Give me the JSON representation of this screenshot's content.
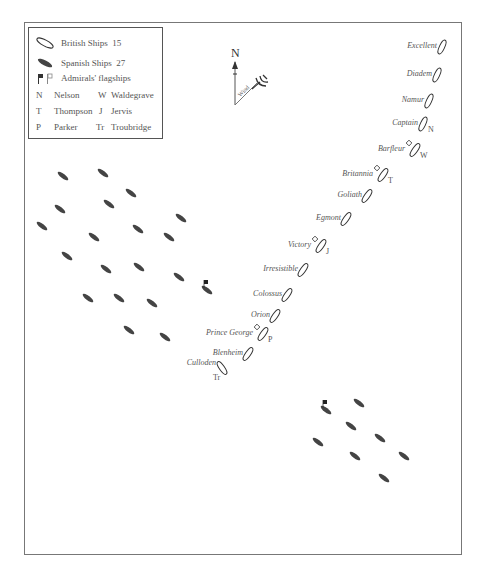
{
  "legend": {
    "british": {
      "label": "British Ships",
      "count": "15"
    },
    "spanish": {
      "label": "Spanish Ships",
      "count": "27"
    },
    "flagships": {
      "label": "Admirals' flagships"
    },
    "admirals": [
      {
        "code": "N",
        "name": "Nelson"
      },
      {
        "code": "W",
        "name": "Waldegrave"
      },
      {
        "code": "T",
        "name": "Thompson"
      },
      {
        "code": "J",
        "name": "Jervis"
      },
      {
        "code": "P",
        "name": "Parker"
      },
      {
        "code": "Tr",
        "name": "Troubridge"
      }
    ]
  },
  "compass": {
    "north": "N",
    "wind_label": "Wind"
  },
  "colors": {
    "british_outline": "#333333",
    "spanish_fill": "#444444",
    "frame": "#777777"
  },
  "british_ships": [
    {
      "name": "Excellent",
      "x": 442,
      "y": 47
    },
    {
      "name": "Diadem",
      "x": 437,
      "y": 75
    },
    {
      "name": "Namur",
      "x": 429,
      "y": 101
    },
    {
      "name": "Captain",
      "x": 423,
      "y": 124,
      "admiral": "N"
    },
    {
      "name": "Barfleur",
      "x": 415,
      "y": 150,
      "admiral": "W",
      "flag": true
    },
    {
      "name": "Britannia",
      "x": 383,
      "y": 175,
      "admiral": "T",
      "flag": true
    },
    {
      "name": "Goliath",
      "x": 367,
      "y": 196
    },
    {
      "name": "Egmont",
      "x": 346,
      "y": 219
    },
    {
      "name": "Victory",
      "x": 321,
      "y": 246,
      "admiral": "J",
      "flag": true
    },
    {
      "name": "Irresistible",
      "x": 303,
      "y": 270
    },
    {
      "name": "Colossus",
      "x": 287,
      "y": 295
    },
    {
      "name": "Orion",
      "x": 275,
      "y": 316
    },
    {
      "name": "Prince George",
      "x": 263,
      "y": 334,
      "admiral": "P",
      "flag": true
    },
    {
      "name": "Blenheim",
      "x": 248,
      "y": 354
    },
    {
      "name": "Culloden",
      "x": 222,
      "y": 368,
      "admiral": "Tr"
    }
  ],
  "spanish_ships": [
    {
      "x": 63,
      "y": 176
    },
    {
      "x": 103,
      "y": 173
    },
    {
      "x": 131,
      "y": 193
    },
    {
      "x": 60,
      "y": 209
    },
    {
      "x": 109,
      "y": 204
    },
    {
      "x": 181,
      "y": 218
    },
    {
      "x": 42,
      "y": 226
    },
    {
      "x": 138,
      "y": 229
    },
    {
      "x": 94,
      "y": 237
    },
    {
      "x": 169,
      "y": 237
    },
    {
      "x": 67,
      "y": 256
    },
    {
      "x": 106,
      "y": 269
    },
    {
      "x": 139,
      "y": 267
    },
    {
      "x": 179,
      "y": 277
    },
    {
      "x": 207,
      "y": 290,
      "flag": true
    },
    {
      "x": 88,
      "y": 298
    },
    {
      "x": 119,
      "y": 298
    },
    {
      "x": 152,
      "y": 303
    },
    {
      "x": 129,
      "y": 330
    },
    {
      "x": 165,
      "y": 337
    },
    {
      "x": 326,
      "y": 410,
      "flag": true
    },
    {
      "x": 359,
      "y": 403
    },
    {
      "x": 351,
      "y": 426
    },
    {
      "x": 318,
      "y": 442
    },
    {
      "x": 380,
      "y": 438
    },
    {
      "x": 355,
      "y": 456
    },
    {
      "x": 404,
      "y": 456
    },
    {
      "x": 384,
      "y": 478
    }
  ]
}
